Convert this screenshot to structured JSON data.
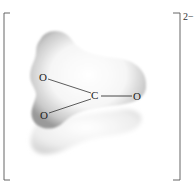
{
  "diagram": {
    "charge": "2−",
    "atoms": [
      {
        "id": "O1",
        "label": "O"
      },
      {
        "id": "C",
        "label": "C"
      },
      {
        "id": "O2",
        "label": "O"
      },
      {
        "id": "O3",
        "label": "O"
      }
    ],
    "bonds": [
      {
        "from": "C",
        "to": "O1"
      },
      {
        "from": "C",
        "to": "O2"
      },
      {
        "from": "C",
        "to": "O3"
      }
    ],
    "colors": {
      "cloud_edge": "#8a8a8a",
      "cloud_center": "#ffffff",
      "bracket": "#555555",
      "bond": "#333333"
    }
  }
}
